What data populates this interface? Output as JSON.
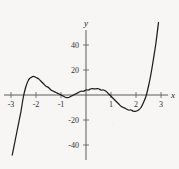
{
  "figure": {
    "background_color": "#f7f6f4",
    "curve_color": "#1d1d1d",
    "axis_color": "#4a4a4a"
  },
  "labels": {
    "x_axis_name": "x",
    "y_axis_name": "y"
  },
  "chart_data": {
    "type": "line",
    "title": "",
    "subtitle": "",
    "xlabel": "x",
    "ylabel": "y",
    "xlim": [
      -3.1,
      3.1
    ],
    "ylim": [
      -50,
      52
    ],
    "grid": false,
    "legend": "none",
    "x_ticks": [
      -3,
      -2,
      -1,
      1,
      2,
      3
    ],
    "x_tick_labels": [
      "-3",
      "-2",
      "-1",
      "1",
      "2",
      "3"
    ],
    "y_ticks": [
      40,
      20,
      -20,
      -40
    ],
    "y_tick_labels": [
      "40",
      "20",
      "-20",
      "-40"
    ],
    "annotations": [],
    "series": [
      {
        "name": "polynomial",
        "x": [
          -2.95,
          -2.85,
          -2.75,
          -2.65,
          -2.6,
          -2.5,
          -2.4,
          -2.3,
          -2.2,
          -2.1,
          -2.0,
          -1.9,
          -1.8,
          -1.7,
          -1.6,
          -1.5,
          -1.4,
          -1.3,
          -1.2,
          -1.1,
          -1.0,
          -0.9,
          -0.8,
          -0.7,
          -0.6,
          -0.5,
          -0.4,
          -0.3,
          -0.2,
          -0.1,
          0.0,
          0.1,
          0.2,
          0.3,
          0.4,
          0.5,
          0.6,
          0.7,
          0.8,
          0.9,
          1.0,
          1.1,
          1.2,
          1.3,
          1.4,
          1.5,
          1.6,
          1.7,
          1.8,
          1.9,
          2.0,
          2.1,
          2.2,
          2.3,
          2.4,
          2.5,
          2.6,
          2.7,
          2.8,
          2.9
        ],
        "y": [
          -48,
          -38,
          -28,
          -18,
          -13,
          -1,
          7,
          12,
          14,
          15,
          14,
          13,
          11,
          9,
          7,
          6,
          4,
          3,
          2,
          1,
          0,
          -1,
          -2,
          -2,
          -1,
          0,
          1,
          2,
          3,
          3,
          4,
          4,
          5,
          5,
          5,
          5,
          4,
          4,
          3,
          1,
          -1,
          -3,
          -5,
          -7,
          -9,
          -10,
          -11,
          -12,
          -12,
          -13,
          -13,
          -12,
          -10,
          -6,
          -1,
          7,
          17,
          29,
          42,
          58
        ]
      }
    ]
  }
}
